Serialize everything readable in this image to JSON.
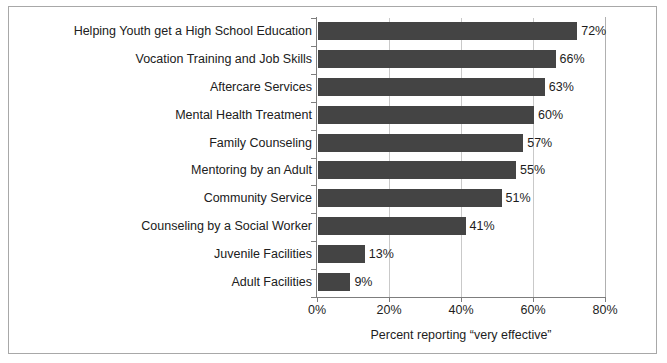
{
  "chart_data": {
    "type": "bar",
    "orientation": "horizontal",
    "title": "",
    "xlabel": "Percent reporting “very effective”",
    "ylabel": "",
    "xlim": [
      0,
      80
    ],
    "xticks": [
      0,
      20,
      40,
      60,
      80
    ],
    "xtick_labels": [
      "0%",
      "20%",
      "40%",
      "60%",
      "80%"
    ],
    "grid": "vertical",
    "legend": "none",
    "bar_color": "#444444",
    "categories": [
      "Helping Youth get a High School Education",
      "Vocation Training and Job Skills",
      "Aftercare Services",
      "Mental Health Treatment",
      "Family Counseling",
      "Mentoring by an Adult",
      "Community Service",
      "Counseling by a Social Worker",
      "Juvenile Facilities",
      "Adult Facilities"
    ],
    "values": [
      72,
      66,
      63,
      60,
      57,
      55,
      51,
      41,
      13,
      9
    ],
    "value_labels": [
      "72%",
      "66%",
      "63%",
      "60%",
      "57%",
      "55%",
      "51%",
      "41%",
      "13%",
      "9%"
    ]
  }
}
